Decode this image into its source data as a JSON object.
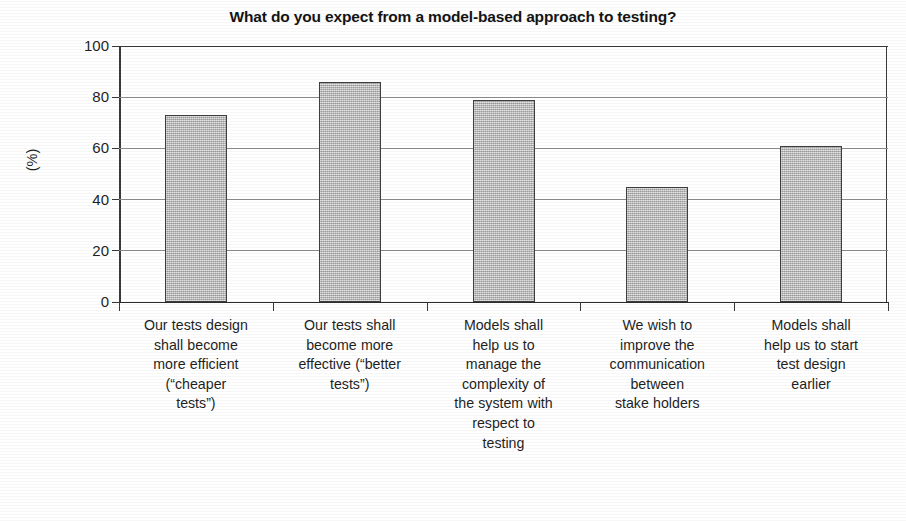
{
  "chart_data": {
    "type": "bar",
    "title": "What do you expect from a model-based approach to testing?",
    "xlabel": "",
    "ylabel": "(%)",
    "ylim": [
      0,
      100
    ],
    "ytick_values": [
      100,
      80,
      60,
      40,
      20,
      0
    ],
    "ytick_labels": [
      "100",
      "80",
      "60",
      "40",
      "20",
      "0"
    ],
    "grid": "horizontal",
    "legend": "none",
    "categories": [
      "Our tests design shall become more efficient (“cheaper tests”)",
      "Our tests shall become more effective (“better tests”)",
      "Models shall help us to manage the complexity of the system with respect to testing",
      "We wish to improve the communication between stake holders",
      "Models shall help us to start test design earlier"
    ],
    "category_lines": [
      [
        "Our tests design",
        "shall become",
        "more efficient",
        "(“cheaper",
        "tests”)"
      ],
      [
        "Our tests shall",
        "become more",
        "effective (“better",
        "tests”)"
      ],
      [
        "Models shall",
        "help us to",
        "manage the",
        "complexity of",
        "the system with",
        "respect to",
        "testing"
      ],
      [
        "We wish to",
        "improve the",
        "communication",
        "between",
        "stake holders"
      ],
      [
        "Models shall",
        "help us to start",
        "test design",
        "earlier"
      ]
    ],
    "values": [
      73,
      86,
      79,
      45,
      61
    ],
    "bar_color": "#bdbdbd",
    "bar_border_color": "#3f3f3f",
    "axis_color": "#3a3a3a",
    "gridline_color": "#8e8e8e",
    "text_color": "#1f1f1f"
  }
}
